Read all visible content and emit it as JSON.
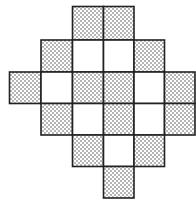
{
  "diagram": {
    "type": "grid-tiling",
    "colors": {
      "background": "#ffffff",
      "outline": "#222222",
      "stipple": "#333333",
      "shaded_base": "#e6e6e6"
    },
    "rows": [
      {
        "row": 0,
        "cells": [
          {
            "col": 2,
            "shaded": true
          },
          {
            "col": 3,
            "shaded": true
          }
        ]
      },
      {
        "row": 1,
        "cells": [
          {
            "col": 1,
            "shaded": true
          },
          {
            "col": 2,
            "shaded": false
          },
          {
            "col": 3,
            "shaded": false
          },
          {
            "col": 4,
            "shaded": true
          }
        ]
      },
      {
        "row": 2,
        "cells": [
          {
            "col": 0,
            "shaded": true
          },
          {
            "col": 1,
            "shaded": false
          },
          {
            "col": 2,
            "shaded": true
          },
          {
            "col": 3,
            "shaded": true
          },
          {
            "col": 4,
            "shaded": false
          },
          {
            "col": 5,
            "shaded": true
          }
        ]
      },
      {
        "row": 3,
        "cells": [
          {
            "col": 1,
            "shaded": true
          },
          {
            "col": 2,
            "shaded": false
          },
          {
            "col": 3,
            "shaded": true
          },
          {
            "col": 4,
            "shaded": false
          },
          {
            "col": 5,
            "shaded": true
          }
        ]
      },
      {
        "row": 4,
        "cells": [
          {
            "col": 2,
            "shaded": true
          },
          {
            "col": 3,
            "shaded": false
          },
          {
            "col": 4,
            "shaded": true
          }
        ]
      },
      {
        "row": 5,
        "cells": [
          {
            "col": 3,
            "shaded": true
          }
        ]
      }
    ],
    "counts": {
      "total_cells": 21,
      "shaded_cells": 13,
      "white_cells": 8
    }
  }
}
